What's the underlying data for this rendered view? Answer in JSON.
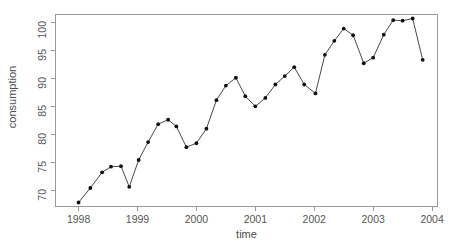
{
  "chart_data": {
    "type": "line",
    "title": "",
    "subtitle": "",
    "xlabel": "time",
    "ylabel": "consumption",
    "xlim": [
      1997.6,
      2004.1
    ],
    "ylim": [
      67.0,
      101.5
    ],
    "xticks": [
      1998,
      1999,
      2000,
      2001,
      2002,
      2003,
      2004
    ],
    "xtick_labels": [
      "1998",
      "1999",
      "2000",
      "2001",
      "2002",
      "2003",
      "2004"
    ],
    "yticks": [
      70,
      75,
      80,
      85,
      90,
      95,
      100
    ],
    "ytick_labels": [
      "70",
      "75",
      "80",
      "85",
      "90",
      "95",
      "100"
    ],
    "grid": false,
    "legend": null,
    "marker": "filled-circle",
    "marker_color": "#111111",
    "line_color": "#333333",
    "frame_color": "#9a9a9a",
    "frequency": "quarterly",
    "x": [
      1998.0,
      1998.25,
      1998.5,
      1998.75,
      1999.0,
      1999.25,
      1999.5,
      1999.75,
      2000.0,
      2000.25,
      2000.5,
      2000.75,
      2001.0,
      2001.25,
      2001.5,
      2001.75,
      2002.0,
      2002.25,
      2002.5,
      2002.75,
      2003.0,
      2003.25,
      2003.5,
      2003.75
    ],
    "values": [
      67.8,
      70.4,
      73.2,
      74.2,
      74.3,
      70.6,
      75.4,
      78.6,
      81.8,
      82.6,
      81.4,
      77.7,
      78.4,
      81.0,
      86.1,
      88.7,
      90.1,
      86.8,
      85.0,
      86.5,
      88.9,
      90.4,
      92.0,
      88.9
    ],
    "series": [
      {
        "name": "consumption",
        "x": [
          1998.0,
          1998.2,
          1998.4,
          1998.6,
          1998.8,
          1999.0,
          1999.2,
          1999.4,
          1999.6,
          1999.8,
          2000.0,
          2000.2,
          2000.4,
          2000.6,
          2000.8,
          2001.0,
          2001.2,
          2001.4,
          2001.6,
          2001.8,
          2002.0,
          2002.2,
          2002.4,
          2002.6,
          2002.8,
          2003.0,
          2003.2,
          2003.4,
          2003.6,
          2003.8
        ],
        "values": [
          67.8,
          70.4,
          73.2,
          74.2,
          74.3,
          70.6,
          75.4,
          78.6,
          81.8,
          82.6,
          81.4,
          77.7,
          78.4,
          81.0,
          86.1,
          88.7,
          90.1,
          86.8,
          85.0,
          86.5,
          88.9,
          90.4,
          92.0,
          88.9,
          87.3,
          94.2,
          96.7,
          98.9,
          97.7,
          92.7
        ]
      }
    ],
    "points": [
      {
        "x": 1998.0,
        "y": 67.8
      },
      {
        "x": 1998.2,
        "y": 70.4
      },
      {
        "x": 1998.4,
        "y": 73.2
      },
      {
        "x": 1998.55,
        "y": 74.2
      },
      {
        "x": 1998.72,
        "y": 74.3
      },
      {
        "x": 1998.86,
        "y": 70.6
      },
      {
        "x": 1999.02,
        "y": 75.4
      },
      {
        "x": 1999.18,
        "y": 78.6
      },
      {
        "x": 1999.35,
        "y": 81.8
      },
      {
        "x": 1999.52,
        "y": 82.6
      },
      {
        "x": 1999.66,
        "y": 81.4
      },
      {
        "x": 1999.83,
        "y": 77.7
      },
      {
        "x": 2000.0,
        "y": 78.4
      },
      {
        "x": 2000.17,
        "y": 81.0
      },
      {
        "x": 2000.34,
        "y": 86.1
      },
      {
        "x": 2000.5,
        "y": 88.7
      },
      {
        "x": 2000.67,
        "y": 90.1
      },
      {
        "x": 2000.83,
        "y": 86.8
      },
      {
        "x": 2001.0,
        "y": 85.0
      },
      {
        "x": 2001.17,
        "y": 86.5
      },
      {
        "x": 2001.34,
        "y": 88.9
      },
      {
        "x": 2001.5,
        "y": 90.4
      },
      {
        "x": 2001.66,
        "y": 92.0
      },
      {
        "x": 2001.83,
        "y": 88.9
      },
      {
        "x": 2002.02,
        "y": 87.3
      },
      {
        "x": 2002.18,
        "y": 94.2
      },
      {
        "x": 2002.34,
        "y": 96.7
      },
      {
        "x": 2002.5,
        "y": 98.9
      },
      {
        "x": 2002.66,
        "y": 97.7
      },
      {
        "x": 2002.84,
        "y": 92.7
      },
      {
        "x": 2003.0,
        "y": 93.7
      },
      {
        "x": 2003.18,
        "y": 97.8
      },
      {
        "x": 2003.34,
        "y": 100.4
      },
      {
        "x": 2003.5,
        "y": 100.3
      },
      {
        "x": 2003.67,
        "y": 100.7
      },
      {
        "x": 2003.84,
        "y": 93.3
      }
    ]
  }
}
